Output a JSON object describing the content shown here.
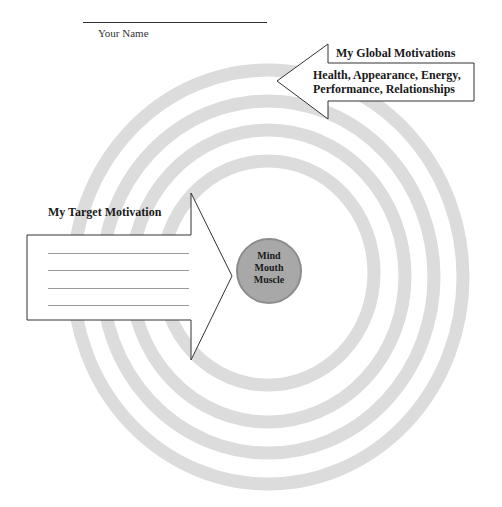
{
  "header": {
    "name_label": "Your Name"
  },
  "global_motivations": {
    "title": "My Global Motivations",
    "line1": "Health, Appearance, Energy,",
    "line2": "Performance, Relationships"
  },
  "target_motivation": {
    "title": "My Target Motivation",
    "blank_lines": 4
  },
  "center": {
    "line1": "Mind",
    "line2": "Mouth",
    "line3": "Muscle"
  },
  "colors": {
    "ring": "#dcdcdc",
    "center_fill": "#a8a8a8",
    "center_stroke": "#8c8c8c",
    "arrow_stroke": "#333333"
  },
  "rings": [
    {
      "rx": 195,
      "ry": 207
    },
    {
      "rx": 166,
      "ry": 176
    },
    {
      "rx": 137,
      "ry": 146
    },
    {
      "rx": 106,
      "ry": 112
    }
  ]
}
